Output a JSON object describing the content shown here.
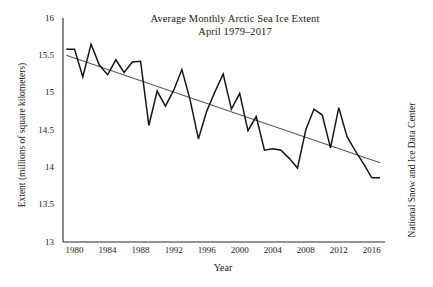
{
  "chart_data": {
    "type": "line",
    "title": "Average Monthly Arctic Sea Ice Extent",
    "subtitle": "April 1979–2017",
    "xlabel": "Year",
    "ylabel": "Extent (millions of square kilometers)",
    "right_label": "National Snow and Ice Data Center",
    "xlim": [
      1978.6,
      2017.6
    ],
    "ylim": [
      13,
      16
    ],
    "yticks": [
      "13",
      "13.5",
      "14",
      "14.5",
      "15",
      "15.5",
      "16"
    ],
    "ytick_values": [
      13,
      13.5,
      14,
      14.5,
      15,
      15.5,
      16
    ],
    "xticks": [
      "1980",
      "1984",
      "1988",
      "1992",
      "1996",
      "2000",
      "2004",
      "2008",
      "2012",
      "2016"
    ],
    "xtick_values": [
      1980,
      1984,
      1988,
      1992,
      1996,
      2000,
      2004,
      2008,
      2012,
      2016
    ],
    "grid": false,
    "legend": false,
    "series": [
      {
        "name": "April sea ice extent",
        "color": "#161616",
        "x": [
          1979,
          1980,
          1981,
          1982,
          1983,
          1984,
          1985,
          1986,
          1987,
          1988,
          1989,
          1990,
          1991,
          1992,
          1993,
          1994,
          1995,
          1996,
          1997,
          1998,
          1999,
          2000,
          2001,
          2002,
          2003,
          2004,
          2005,
          2006,
          2007,
          2008,
          2009,
          2010,
          2011,
          2012,
          2013,
          2014,
          2015,
          2016,
          2017
        ],
        "values": [
          15.58,
          15.58,
          15.21,
          15.65,
          15.37,
          15.24,
          15.44,
          15.27,
          15.41,
          15.42,
          14.56,
          15.02,
          14.82,
          15.03,
          15.31,
          14.9,
          14.38,
          14.75,
          15.01,
          15.25,
          14.78,
          14.99,
          14.49,
          14.68,
          14.23,
          14.25,
          14.23,
          14.12,
          13.99,
          14.5,
          14.78,
          14.7,
          14.26,
          14.8,
          14.41,
          14.22,
          14.05,
          13.86,
          13.86
        ]
      },
      {
        "name": "linear trend",
        "color": "#5a5a5a",
        "x": [
          1979,
          2017
        ],
        "values": [
          15.5,
          14.06
        ]
      }
    ]
  }
}
